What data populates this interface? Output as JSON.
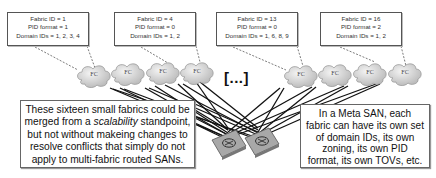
{
  "fabrics": [
    {
      "id_line": "Fabric ID = 1",
      "pid_line": "PID format = 1",
      "domain_line": "Domain IDs = 1, 2, 3, 4"
    },
    {
      "id_line": "Fabric ID = 4",
      "pid_line": "PID format = 0",
      "domain_line": "Domain IDs = 1, 2"
    },
    {
      "id_line": "Fabric ID = 13",
      "pid_line": "PID format = 0",
      "domain_line": "Domain IDs = 1, 6, 8, 9"
    },
    {
      "id_line": "Fabric ID = 16",
      "pid_line": "PID format = 2",
      "domain_line": "Domain IDs = 1, 2"
    }
  ],
  "cloud_label": "FC",
  "ellipsis": "[...]",
  "left_note": {
    "line1": "These sixteen small fabrics could be",
    "line2_pre": "merged from a ",
    "line2_em": "scalability",
    "line2_post": " standpoint,",
    "line3": "but not without makeing changes to",
    "line4": "resolve conflicts that simply do not",
    "line5": "apply to multi-fabric routed SANs."
  },
  "right_note": {
    "line1": "In a Meta SAN, each",
    "line2": "fabric can have its own set",
    "line3": "of domain IDs, its own",
    "line4": "zoning, its own PID",
    "line5": "format, its own TOVs, etc."
  },
  "colors": {
    "cloud_fill": "#d9d9d9",
    "router_fill": "#a8a8a8",
    "link": "#111111",
    "dashed": "#444444"
  }
}
